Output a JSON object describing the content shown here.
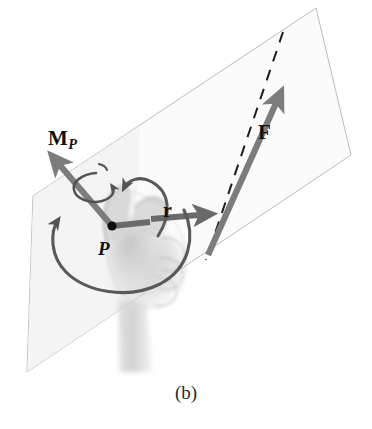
{
  "figure": {
    "caption": "(b)"
  },
  "labels": {
    "moment": {
      "symbol": "M",
      "subscript": "P"
    },
    "force": {
      "symbol": "F"
    },
    "position": {
      "symbol": "r"
    },
    "point": {
      "symbol": "P"
    }
  },
  "colors": {
    "vector_gray": "#7c7c7c",
    "vector_dark_gray": "#6a6a6a",
    "curve_gray": "#595959",
    "plane_edge": "#b9b9b9",
    "plane_fill": "#fbfbfb",
    "dashed_line": "#1c1c1c",
    "hand_tint": "#b8b8b8",
    "label_text": "#111111",
    "background": "#ffffff"
  },
  "geometry": {
    "plane_corners": [
      [
        33,
        196
      ],
      [
        316,
        8
      ],
      [
        351,
        155
      ],
      [
        27,
        372
      ]
    ],
    "point_P": [
      112,
      226
    ],
    "force_arrow": {
      "from": [
        208,
        255
      ],
      "to": [
        283,
        88
      ]
    },
    "moment_arrow": {
      "from": [
        112,
        226
      ],
      "to": [
        49,
        152
      ]
    },
    "position_arrow": {
      "from": [
        112,
        226
      ],
      "to": [
        212,
        215
      ]
    },
    "r_arrow_visible": {
      "from": [
        147,
        219
      ],
      "to": [
        212,
        215
      ]
    },
    "dashed_line": {
      "from": [
        283,
        32
      ],
      "to": [
        206,
        260
      ]
    }
  },
  "elements": {
    "plane_name": "force-plane",
    "dashed_name": "line-of-action",
    "hand_name": "right-hand-illustration",
    "rotation_small": "moment-rotation-arrow-small",
    "rotation_large": "moment-rotation-arrow-large",
    "rotation_top": "finger-curl-arrow"
  }
}
